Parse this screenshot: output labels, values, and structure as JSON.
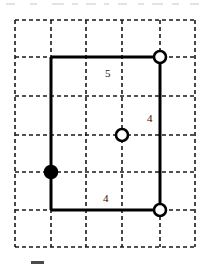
{
  "figure": {
    "type": "geometry-diagram",
    "background_color": "#ffffff",
    "line_color": "#000000",
    "grid_color": "#1a1a1a",
    "grid": {
      "style": "dashed",
      "x_lines": [
        15,
        51,
        86,
        122,
        160,
        195
      ],
      "y_lines": [
        20,
        57,
        96,
        135,
        172,
        210,
        247
      ],
      "left": 15,
      "right": 195,
      "top": 20,
      "bottom": 247,
      "columns": 5,
      "rows": 6
    },
    "rectangle": {
      "left": 51,
      "top": 57,
      "right": 160,
      "bottom": 210,
      "stroke_width": 3
    },
    "labels": [
      {
        "text": "5",
        "x": 105,
        "y": 68,
        "edge": "top"
      },
      {
        "text": "4",
        "x": 147,
        "y": 113,
        "edge": "right"
      },
      {
        "text": "4",
        "x": 103,
        "y": 193,
        "edge": "bottom"
      }
    ],
    "points": [
      {
        "name": "top-right-vertex",
        "x": 160,
        "y": 57,
        "style": "open",
        "radius": 6
      },
      {
        "name": "center-point",
        "x": 122,
        "y": 135,
        "style": "open",
        "radius": 6
      },
      {
        "name": "bottom-right-vertex",
        "x": 160,
        "y": 210,
        "style": "open",
        "radius": 6
      },
      {
        "name": "left-edge-point",
        "x": 51,
        "y": 172,
        "style": "filled",
        "radius": 6
      }
    ]
  },
  "caption": {
    "text": "",
    "visible": false,
    "note_color": "#4a4a4a"
  }
}
